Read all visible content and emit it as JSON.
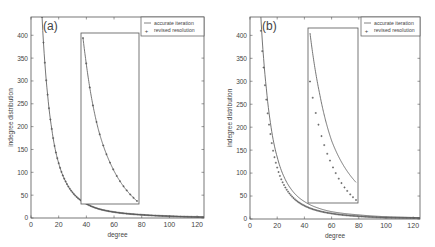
{
  "figure": {
    "background": "#ffffff",
    "axis_color": "#555555",
    "line_color": "#666666",
    "marker_color": "#555555"
  },
  "chart_data": [
    {
      "type": "line",
      "panel_label": "(a)",
      "title": "",
      "xlabel": "degree",
      "ylabel": "indegree distribution",
      "xlim": [
        0,
        125
      ],
      "ylim": [
        0,
        440
      ],
      "xticks": [
        0,
        20,
        40,
        60,
        80,
        100,
        120
      ],
      "yticks": [
        0,
        50,
        100,
        150,
        200,
        250,
        300,
        350,
        400
      ],
      "grid": false,
      "legend": {
        "position": "upper right",
        "entries": [
          "accurate iteration",
          "revised resolution"
        ]
      },
      "series": [
        {
          "name": "accurate iteration",
          "style": "line",
          "x": [
            8,
            10,
            12,
            15,
            20,
            25,
            30,
            40,
            50,
            60,
            80,
            100,
            125
          ],
          "y": [
            440,
            340,
            270,
            195,
            120,
            80,
            56,
            31,
            19,
            13,
            7,
            4,
            2
          ]
        },
        {
          "name": "revised resolution",
          "style": "markers",
          "x": [
            8,
            10,
            12,
            15,
            20,
            25,
            30,
            40,
            50,
            60,
            80,
            100,
            125
          ],
          "y": [
            440,
            340,
            270,
            195,
            120,
            80,
            56,
            31,
            19,
            13,
            7,
            4,
            2
          ]
        }
      ],
      "inset": {
        "description": "zoomed view of curve, x 38–80",
        "agreement": "markers lie on the line"
      }
    },
    {
      "type": "line",
      "panel_label": "(b)",
      "title": "",
      "xlabel": "degree",
      "ylabel": "indegree distribution",
      "xlim": [
        0,
        125
      ],
      "ylim": [
        0,
        440
      ],
      "xticks": [
        0,
        20,
        40,
        60,
        80,
        100,
        120
      ],
      "yticks": [
        0,
        50,
        100,
        150,
        200,
        250,
        300,
        350,
        400
      ],
      "grid": false,
      "legend": {
        "position": "upper right",
        "entries": [
          "accurate iteration",
          "revised resolution"
        ]
      },
      "series": [
        {
          "name": "accurate iteration",
          "style": "line",
          "x": [
            8,
            10,
            12,
            15,
            20,
            25,
            30,
            40,
            50,
            60,
            80,
            100,
            125
          ],
          "y": [
            440,
            350,
            285,
            210,
            135,
            92,
            66,
            38,
            24,
            16,
            9,
            5,
            3
          ]
        },
        {
          "name": "revised resolution",
          "style": "markers",
          "x": [
            8,
            10,
            12,
            15,
            20,
            25,
            30,
            40,
            50,
            60,
            80,
            100,
            125
          ],
          "y": [
            410,
            330,
            260,
            185,
            112,
            74,
            52,
            29,
            18,
            12,
            6,
            3,
            2
          ]
        }
      ],
      "inset": {
        "description": "zoomed view of curve, x 42–80",
        "agreement": "markers lie below the line"
      }
    }
  ]
}
